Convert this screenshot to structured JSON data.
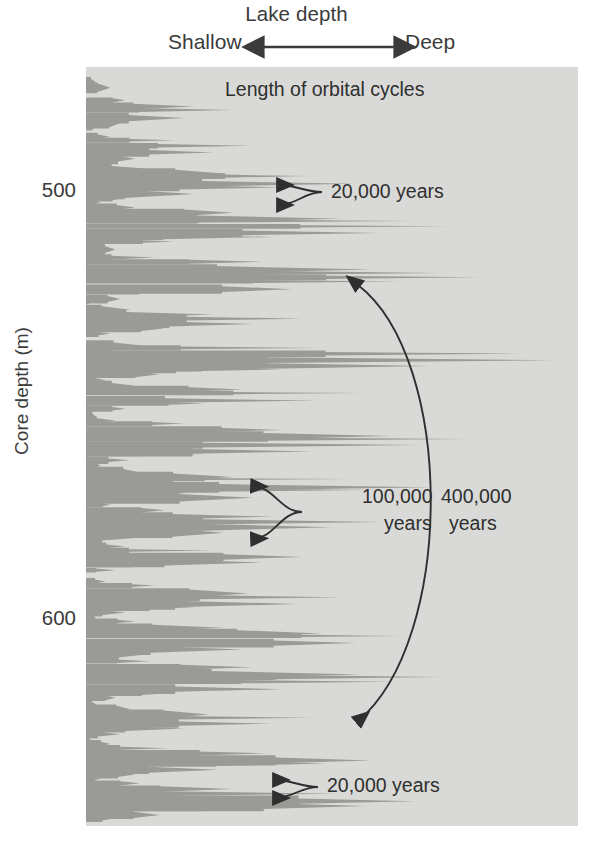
{
  "figure": {
    "background_color": "#ffffff",
    "plot_background_color": "#d9dad7",
    "trace_fill_color": "#9a9b96",
    "text_color": "#3b3b3b",
    "annotation_color": "#2f2f2f"
  },
  "top_axis": {
    "title": "Lake depth",
    "left_label": "Shallow",
    "right_label": "Deep",
    "arrow_icon": "double-headed-horizontal-arrow-icon"
  },
  "y_axis": {
    "label": "Core depth (m)",
    "ticks": [
      {
        "value": "500",
        "top_px": 178
      },
      {
        "value": "600",
        "top_px": 606
      }
    ],
    "range_note": "increasing downward"
  },
  "annotations": {
    "header": "Length of orbital cycles",
    "cycle_20k_top": "20,000 years",
    "cycle_100k_line1": "100,000",
    "cycle_100k_line2": "years",
    "cycle_400k_line1": "400,000",
    "cycle_400k_line2": "years",
    "cycle_20k_bottom": "20,000 years"
  },
  "chart_data": {
    "type": "area",
    "subtitle": "Length of orbital cycles",
    "xlabel": "Lake depth",
    "ylabel": "Core depth (m)",
    "x_direction": "left = Shallow, right = Deep",
    "y_direction": "downward increasing depth",
    "ylim": [
      485,
      640
    ],
    "y_tick_values": [
      500,
      600
    ],
    "grid": false,
    "legend": false,
    "orientation": "horizontal-wiggle-trace",
    "orbital_cycles": [
      {
        "label": "20,000 years",
        "period_years": 20000,
        "depth_m_approx": 503,
        "marker": "double-arrow-bracket"
      },
      {
        "label": "100,000 years",
        "period_years": 100000,
        "depth_m_approx": 563,
        "marker": "double-arrow-bracket"
      },
      {
        "label": "400,000 years",
        "period_years": 400000,
        "depth_m_approx": 590,
        "marker": "large-arc-double-arrow"
      },
      {
        "label": "20,000 years",
        "period_years": 20000,
        "depth_m_approx": 628,
        "marker": "double-arrow-bracket"
      }
    ],
    "series": [
      {
        "name": "Lake depth proxy",
        "note": "Wiggle trace: each value is the rightward (deeper-lake) extent of the filled wedge, in plot-width fraction 0 (shallow) to 1 (deep), sampled downcore.",
        "y_px_start": 67,
        "y_px_end": 826,
        "values": [
          0.0,
          0.0,
          0.02,
          0.05,
          0.03,
          0.0,
          0.08,
          0.22,
          0.3,
          0.2,
          0.07,
          0.02,
          0.0,
          0.05,
          0.18,
          0.34,
          0.26,
          0.1,
          0.04,
          0.12,
          0.28,
          0.45,
          0.55,
          0.4,
          0.22,
          0.08,
          0.03,
          0.1,
          0.3,
          0.52,
          0.66,
          0.74,
          0.6,
          0.38,
          0.18,
          0.06,
          0.02,
          0.14,
          0.36,
          0.58,
          0.72,
          0.8,
          0.64,
          0.42,
          0.2,
          0.07,
          0.01,
          0.09,
          0.26,
          0.44,
          0.34,
          0.16,
          0.05,
          0.0,
          0.12,
          0.48,
          0.88,
          0.95,
          0.7,
          0.4,
          0.15,
          0.04,
          0.1,
          0.32,
          0.56,
          0.47,
          0.24,
          0.08,
          0.02,
          0.06,
          0.2,
          0.4,
          0.62,
          0.78,
          0.68,
          0.46,
          0.24,
          0.09,
          0.03,
          0.11,
          0.3,
          0.54,
          0.7,
          0.58,
          0.34,
          0.14,
          0.05,
          0.16,
          0.38,
          0.6,
          0.5,
          0.28,
          0.1,
          0.02,
          0.08,
          0.26,
          0.44,
          0.36,
          0.18,
          0.06,
          0.0,
          0.04,
          0.14,
          0.33,
          0.52,
          0.43,
          0.22,
          0.08,
          0.02,
          0.1,
          0.28,
          0.48,
          0.64,
          0.55,
          0.32,
          0.12,
          0.04,
          0.13,
          0.34,
          0.56,
          0.72,
          0.63,
          0.4,
          0.18,
          0.06,
          0.02,
          0.09,
          0.25,
          0.46,
          0.38,
          0.2,
          0.07,
          0.01,
          0.05,
          0.17,
          0.37,
          0.58,
          0.49,
          0.27,
          0.1,
          0.03,
          0.11,
          0.3,
          0.51,
          0.67,
          0.57,
          0.35,
          0.15,
          0.05,
          0.0
        ]
      }
    ]
  }
}
